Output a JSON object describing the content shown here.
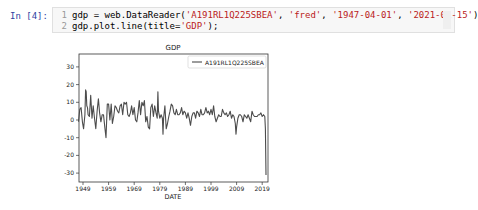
{
  "cell": {
    "prompt": "In [4]:",
    "lines": [
      {
        "num": "1",
        "pre": "gdp = web.DataReader(",
        "s1": "'A191RL1Q225SBEA'",
        "c1": ", ",
        "s2": "'fred'",
        "c2": ", ",
        "s3": "'1947-04-01'",
        "c3": ", ",
        "s4": "'2021-01-15'",
        "post": ")"
      },
      {
        "num": "2",
        "pre": "gdp.plot.line(title=",
        "s1": "'GDP'",
        "post": ");"
      }
    ]
  },
  "chart_data": {
    "type": "line",
    "title": "GDP",
    "xlabel": "DATE",
    "ylabel": "",
    "legend": [
      "A191RL1Q225SBEA"
    ],
    "legend_position": "upper right",
    "grid": false,
    "xlim": [
      1947.25,
      2020.75
    ],
    "ylim": [
      -36,
      37
    ],
    "x_ticks": [
      "1949",
      "1959",
      "1969",
      "1979",
      "1989",
      "1999",
      "2009",
      "2019"
    ],
    "y_ticks": [
      "-30",
      "-20",
      "-10",
      "0",
      "10",
      "20",
      "30"
    ],
    "series": [
      {
        "name": "A191RL1Q225SBEA",
        "x": [
          1947.25,
          1947.75,
          1948.25,
          1948.75,
          1949.25,
          1949.75,
          1950.0,
          1950.25,
          1950.5,
          1950.75,
          1951.0,
          1951.5,
          1952.0,
          1952.5,
          1953.0,
          1953.5,
          1954.0,
          1954.5,
          1955.0,
          1955.5,
          1956.0,
          1956.5,
          1957.0,
          1957.5,
          1958.0,
          1958.5,
          1959.0,
          1959.5,
          1960.0,
          1960.5,
          1961.0,
          1961.5,
          1962.0,
          1962.5,
          1963.0,
          1963.5,
          1964.0,
          1964.5,
          1965.0,
          1965.5,
          1966.0,
          1966.5,
          1967.0,
          1967.5,
          1968.0,
          1968.5,
          1969.0,
          1969.5,
          1970.0,
          1970.5,
          1971.0,
          1971.5,
          1972.0,
          1972.5,
          1973.0,
          1973.5,
          1974.0,
          1974.5,
          1975.0,
          1975.5,
          1976.0,
          1976.5,
          1977.0,
          1977.5,
          1978.0,
          1978.25,
          1978.5,
          1979.0,
          1979.5,
          1980.0,
          1980.25,
          1980.5,
          1981.0,
          1981.5,
          1982.0,
          1982.5,
          1983.0,
          1983.5,
          1984.0,
          1984.5,
          1985.0,
          1985.5,
          1986.0,
          1986.5,
          1987.0,
          1987.5,
          1988.0,
          1988.5,
          1989.0,
          1989.5,
          1990.0,
          1990.5,
          1991.0,
          1991.5,
          1992.0,
          1992.5,
          1993.0,
          1993.5,
          1994.0,
          1994.5,
          1995.0,
          1995.5,
          1996.0,
          1996.5,
          1997.0,
          1997.5,
          1998.0,
          1998.5,
          1999.0,
          1999.5,
          2000.0,
          2000.5,
          2001.0,
          2001.5,
          2002.0,
          2002.5,
          2003.0,
          2003.5,
          2004.0,
          2004.5,
          2005.0,
          2005.5,
          2006.0,
          2006.5,
          2007.0,
          2007.5,
          2008.0,
          2008.5,
          2008.75,
          2009.0,
          2009.5,
          2010.0,
          2010.5,
          2011.0,
          2011.5,
          2012.0,
          2012.5,
          2013.0,
          2013.5,
          2014.0,
          2014.5,
          2015.0,
          2015.5,
          2016.0,
          2016.5,
          2017.0,
          2017.5,
          2018.0,
          2018.5,
          2019.0,
          2019.5,
          2020.0,
          2020.25,
          2020.5
        ],
        "values": [
          -1,
          6,
          7,
          -1,
          -5,
          3,
          17,
          16,
          8,
          7,
          3,
          2,
          14,
          1,
          8,
          1,
          -5,
          5,
          12,
          4,
          -1,
          3,
          3,
          -4,
          -10,
          9,
          9,
          0,
          9,
          -2,
          2,
          8,
          7,
          5,
          4,
          8,
          9,
          3,
          10,
          9,
          10,
          3,
          2,
          4,
          8,
          3,
          7,
          0,
          -1,
          4,
          11,
          3,
          10,
          8,
          11,
          -1,
          2,
          -4,
          -5,
          7,
          9,
          2,
          8,
          4,
          1,
          16,
          5,
          1,
          3,
          1,
          -8,
          1,
          8,
          -5,
          -2,
          2,
          5,
          9,
          8,
          4,
          3,
          6,
          3,
          3,
          4,
          7,
          3,
          5,
          4,
          1,
          4,
          1,
          -3,
          2,
          4,
          4,
          1,
          5,
          4,
          2,
          6,
          3,
          3,
          4,
          7,
          4,
          5,
          3,
          6,
          3,
          8,
          2,
          -1,
          1,
          3,
          2,
          2,
          6,
          4,
          3,
          4,
          2,
          3,
          5,
          1,
          3,
          2,
          -2,
          -8,
          -4,
          1,
          3,
          3,
          2,
          -1,
          3,
          2,
          1,
          3,
          1,
          -1,
          5,
          3,
          2,
          2,
          2,
          3,
          3,
          4,
          2,
          3,
          2,
          -5,
          -31
        ]
      }
    ]
  },
  "colors": {
    "line": "#4c4c4c",
    "prompt": "#303f9f",
    "string": "#ba2121"
  }
}
